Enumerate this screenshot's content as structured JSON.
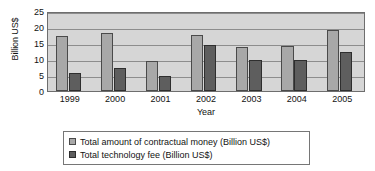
{
  "chart_data": {
    "type": "bar",
    "title": "",
    "subtitle": "",
    "xlabel": "Year",
    "ylabel": "Billion US$",
    "categories": [
      "1999",
      "2000",
      "2001",
      "2002",
      "2003",
      "2004",
      "2005"
    ],
    "series": [
      {
        "name": "Total amount of contractual money (Billion US$)",
        "color": "#a8a8a8",
        "values": [
          17.2,
          18.2,
          9.4,
          17.6,
          13.6,
          14.1,
          19.2
        ]
      },
      {
        "name": "Total technology fee (Billion US$)",
        "color": "#5e5e5e",
        "values": [
          5.6,
          7.2,
          4.7,
          14.5,
          9.8,
          9.8,
          12.1
        ]
      }
    ],
    "ylim": [
      0,
      25
    ],
    "yticks": [
      0,
      5,
      10,
      15,
      20,
      25
    ],
    "ytick_labels": [
      "0",
      "5",
      "10",
      "15",
      "20",
      "25"
    ],
    "grid": true,
    "grid_axis": "y",
    "legend_position": "bottom",
    "plot_background": "#d6d6d6",
    "figure_background": "#ffffff"
  },
  "legend": {
    "items": [
      {
        "label": "Total amount of contractual money (Billion US$)"
      },
      {
        "label": "Total technology fee (Billion US$)"
      }
    ]
  }
}
